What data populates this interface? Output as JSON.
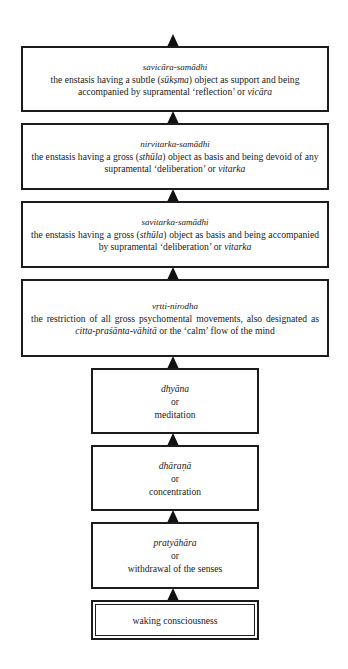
{
  "diagram": {
    "type": "vertical-stage-flow",
    "direction": "bottom-to-top",
    "stages": [
      {
        "id": "savicara-samadhi",
        "term": "savicāra-samādhi",
        "desc_parts": [
          "the enstasis having a subtle (",
          "sūkṣma",
          ") object as support and being accompanied by supramental ‘reflection’ or ",
          "vicāra"
        ]
      },
      {
        "id": "nirvitarka-samadhi",
        "term": "nirvitarka-samādhi",
        "desc_parts": [
          "the enstasis having a gross (",
          "sthūla",
          ") object as basis and being devoid of any supramental ‘deliberation’ or ",
          "vitarka"
        ]
      },
      {
        "id": "savitarka-samadhi",
        "term": "savitarka-samādhi",
        "desc_parts": [
          "the enstasis having a gross (",
          "sthūla",
          ") object as basis and being accompanied by supramental ‘deliberation’ or ",
          "vitarka"
        ]
      },
      {
        "id": "vrtti-nirodha",
        "term": "vṛtti-nirodha",
        "desc_parts": [
          "the restriction of all gross psychomental movements, also designated as ",
          "citta-praśānta-vāhitā",
          " or the ‘calm’ flow of the mind"
        ]
      },
      {
        "id": "dhyana",
        "term": "dhyāna",
        "connector": "or",
        "gloss": "meditation"
      },
      {
        "id": "dharana",
        "term": "dhāraṇā",
        "connector": "or",
        "gloss": "concentration"
      },
      {
        "id": "pratyahara",
        "term": "pratyāhāra",
        "connector": "or",
        "gloss": "withdrawal of the senses"
      },
      {
        "id": "waking-consciousness",
        "label": "waking consciousness"
      }
    ]
  }
}
